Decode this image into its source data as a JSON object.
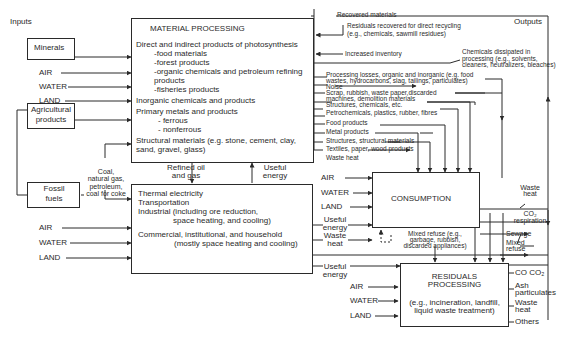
{
  "headings": {
    "inputs": "Inputs",
    "outputs": "Outputs"
  },
  "sources": {
    "minerals": "Minerals",
    "agricultural": [
      "Agricultural",
      "products"
    ],
    "fossil": [
      "Fossil",
      "fuels"
    ],
    "fossil_label": [
      "Coal,",
      "natural gas,",
      "petroleum,",
      "coal for coke"
    ]
  },
  "env_inputs": {
    "air": "AIR",
    "water": "WATER",
    "land": "LAND"
  },
  "material_processing": {
    "title": "MATERIAL PROCESSING",
    "lines": [
      "Direct and indirect products of photosynthesis",
      "-food materials",
      "-forest products",
      "-organic chemicals and petroleum refining",
      "products",
      "-fisheries products",
      "Inorganic chemicals and products",
      "Primary metals and products",
      "- ferrous",
      "- nonferrous",
      "Structural materials (e.g. stone, cement, clay,",
      "sand, gravel, glass)"
    ]
  },
  "energy_conversion": {
    "lines": [
      "Thermal electricity",
      "Transportation",
      "Industrial (including ore reduction,",
      "space heating, and cooling)",
      "Commercial, institutional, and household",
      "(mostly space heating and cooling)"
    ]
  },
  "links": {
    "refined": [
      "Refined oil",
      "and gas"
    ],
    "useful_energy": [
      "Useful",
      "energy"
    ],
    "waste_heat": [
      "Waste",
      "heat"
    ]
  },
  "mp_outputs": [
    "Recovered materials",
    "Residuals recovered for direct recycling",
    "(e.g., chemicals, sawmill residues)",
    "Increased inventory",
    "Chemicals dissipated in",
    "processing (e.g., solvents,",
    "cleaners, neutralizers, bleaches)",
    "Processing losses, organic and inorganic (e.g. food",
    "wastes, hydrocarbons, slag, tailings, particulates)",
    "Noise",
    "Scrap, rubbish, waste paper,discarded",
    "machines, demolition materials",
    "Structures, chemicals, etc.",
    "Petrochemicals, plastics, rubber, fibres",
    "Food products",
    "Metal products",
    "Structures, structural materials",
    "Textiles, paper, wood products",
    "Waste heat"
  ],
  "consumption": {
    "title": "CONSUMPTION",
    "mixed_refuse": [
      "Mixed refuse (e.g.,",
      "garbage, rubbish,",
      "discarded appliances)"
    ]
  },
  "consumption_outputs": {
    "waste_heat": [
      "Waste",
      "heat"
    ],
    "co2": [
      "CO₂",
      "respiration"
    ],
    "sewage": "Sewage",
    "mixed_refuse": [
      "Mixed",
      "refuse"
    ]
  },
  "residuals": {
    "title": [
      "RESIDUALS",
      "PROCESSING"
    ],
    "sub": [
      "(e.g., incineration, landfill,",
      "liquid waste treatment)"
    ],
    "outputs": [
      "CO CO₂",
      "Ash",
      "particulates",
      "Waste",
      "heat",
      "Others"
    ]
  }
}
